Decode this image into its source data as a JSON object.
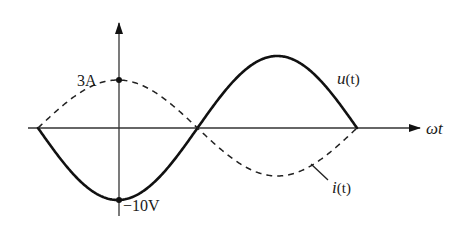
{
  "diagram": {
    "type": "waveform",
    "axes": {
      "x_label": "ωt",
      "y_axis": true
    },
    "annotations": {
      "current_peak": "3A",
      "voltage_min": "−10V"
    },
    "series": [
      {
        "name": "u(t)",
        "label_main": "u",
        "label_arg": "(t)",
        "style": "solid",
        "amplitude": "10V",
        "phase": "starts at 0 going negative"
      },
      {
        "name": "i(t)",
        "label_main": "i",
        "label_arg": "(t)",
        "style": "dashed",
        "amplitude": "3A",
        "phase": "opposite to u(t)"
      }
    ],
    "colors": {
      "stroke": "#111111",
      "background": "#ffffff"
    }
  }
}
